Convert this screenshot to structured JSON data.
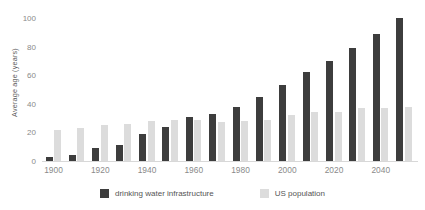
{
  "chart_data": {
    "type": "bar",
    "title": "",
    "xlabel": "",
    "ylabel": "Average age (years)",
    "ylim": [
      0,
      100
    ],
    "yticks": [
      0,
      20,
      40,
      60,
      80,
      100
    ],
    "xticks": [
      "1900",
      "1920",
      "1940",
      "1960",
      "1980",
      "2000",
      "2020",
      "2040"
    ],
    "grid": false,
    "legend_position": "bottom",
    "categories": [
      1900,
      1910,
      1920,
      1930,
      1940,
      1950,
      1960,
      1970,
      1980,
      1990,
      2000,
      2010,
      2020,
      2030,
      2040,
      2050
    ],
    "series": [
      {
        "name": "drinking water infrastructure",
        "color": "#3d3d3d",
        "values": [
          3,
          4,
          9,
          11,
          19,
          24,
          31,
          33,
          38,
          45,
          53,
          62,
          70,
          79,
          89,
          100
        ]
      },
      {
        "name": "US population",
        "color": "#dcdcdc",
        "values": [
          22,
          23,
          25,
          26,
          28,
          29,
          29,
          27,
          28,
          29,
          32,
          34,
          34,
          37,
          37,
          38
        ]
      }
    ]
  },
  "colors": {
    "infrastructure": "#3d3d3d",
    "population": "#dcdcdc",
    "axis_text": "#8a8a8a",
    "label_text": "#555555",
    "baseline": "#d8d8d8"
  }
}
